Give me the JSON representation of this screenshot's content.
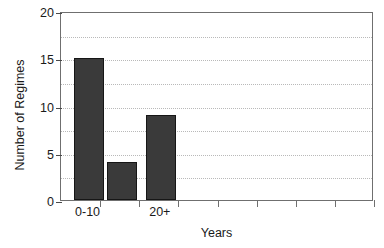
{
  "chart_data": {
    "type": "bar",
    "title": "",
    "xlabel": "Years",
    "ylabel": "Number of Regimes",
    "categories": [
      "0-10",
      "",
      "20+"
    ],
    "values": [
      15,
      4,
      9
    ],
    "ylim": [
      0,
      20
    ],
    "yticks": [
      0,
      5,
      10,
      15,
      20
    ],
    "ytick_labels": [
      "0",
      "5",
      "10",
      "15",
      "20"
    ],
    "gridlines_y": [
      2.5,
      5,
      7.5,
      10,
      12.5,
      15,
      17.5
    ],
    "grid": "dotted-horizontal",
    "legend": "none",
    "bar_color": "#3a3a3a",
    "bar_edge_color": "#161616",
    "axis_color": "#6f6f6f",
    "grid_color": "#b9b9b9",
    "n_xticks": 8,
    "xtick_labels_visible": [
      "0-10",
      "20+"
    ]
  }
}
